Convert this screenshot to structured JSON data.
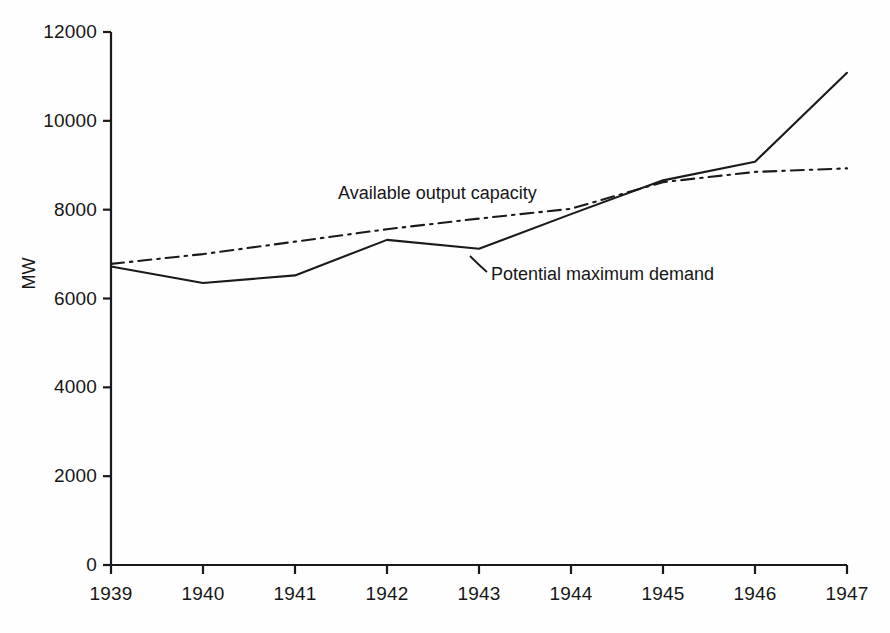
{
  "chart_data": {
    "type": "line",
    "title": "",
    "xlabel": "",
    "ylabel": "MW",
    "x": [
      1939,
      1940,
      1941,
      1942,
      1943,
      1944,
      1945,
      1946,
      1947
    ],
    "xtick_labels": [
      "1939",
      "1940",
      "1941",
      "1942",
      "1943",
      "1944",
      "1945",
      "1946",
      "1947"
    ],
    "ytick_labels": [
      "0",
      "2000",
      "4000",
      "6000",
      "8000",
      "10000",
      "12000"
    ],
    "yticks": [
      0,
      2000,
      4000,
      6000,
      8000,
      10000,
      12000
    ],
    "ylim": [
      0,
      12000
    ],
    "xlim": [
      1939,
      1947
    ],
    "grid": false,
    "legend_position": "inline-annotations",
    "series": [
      {
        "name": "Available output capacity",
        "style": "dash-dot",
        "color": "#1a1a1a",
        "values": [
          6780,
          7000,
          7280,
          7560,
          7800,
          8020,
          8620,
          8850,
          8930
        ]
      },
      {
        "name": "Potential maximum demand",
        "style": "solid",
        "color": "#1a1a1a",
        "values": [
          6720,
          6350,
          6520,
          7320,
          7120,
          7900,
          8660,
          9080,
          11080
        ]
      }
    ],
    "annotations": [
      {
        "text": "Available output capacity",
        "x_px": 338,
        "y_px": 195
      },
      {
        "text": "Potential maximum demand",
        "x_px": 487,
        "y_px": 276
      }
    ]
  },
  "axes": {
    "y_title": "MW",
    "y_ticks": [
      {
        "label": "12000",
        "value": 12000
      },
      {
        "label": "10000",
        "value": 10000
      },
      {
        "label": "8000",
        "value": 8000
      },
      {
        "label": "6000",
        "value": 6000
      },
      {
        "label": "4000",
        "value": 4000
      },
      {
        "label": "2000",
        "value": 2000
      },
      {
        "label": "0",
        "value": 0
      }
    ],
    "x_ticks": [
      {
        "label": "1939",
        "value": 1939
      },
      {
        "label": "1940",
        "value": 1940
      },
      {
        "label": "1941",
        "value": 1941
      },
      {
        "label": "1942",
        "value": 1942
      },
      {
        "label": "1943",
        "value": 1943
      },
      {
        "label": "1944",
        "value": 1944
      },
      {
        "label": "1945",
        "value": 1945
      },
      {
        "label": "1946",
        "value": 1946
      },
      {
        "label": "1947",
        "value": 1947
      }
    ]
  },
  "style": {
    "axis_color": "#1a1a1a",
    "line_color": "#1a1a1a",
    "background": "#fefefe"
  }
}
